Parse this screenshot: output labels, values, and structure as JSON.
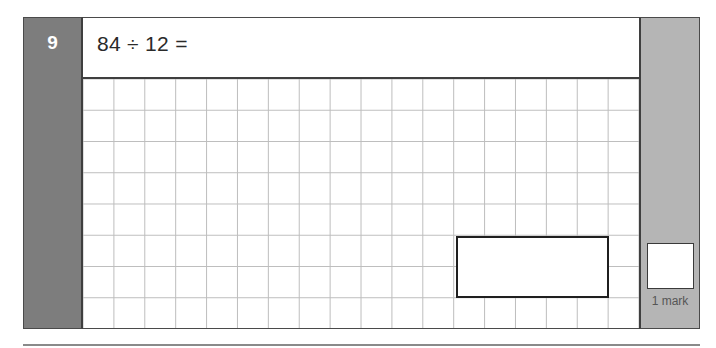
{
  "question": {
    "number": "9",
    "text": "84 ÷ 12 =",
    "answer_value": ""
  },
  "working_grid": {
    "columns": 18,
    "rows": 8
  },
  "marks": {
    "label": "1 mark",
    "value": ""
  },
  "colors": {
    "number_panel": "#7d7d7d",
    "marks_panel": "#b5b5b5",
    "grid_line": "#bdbdbd",
    "border": "#4a4a4a"
  }
}
